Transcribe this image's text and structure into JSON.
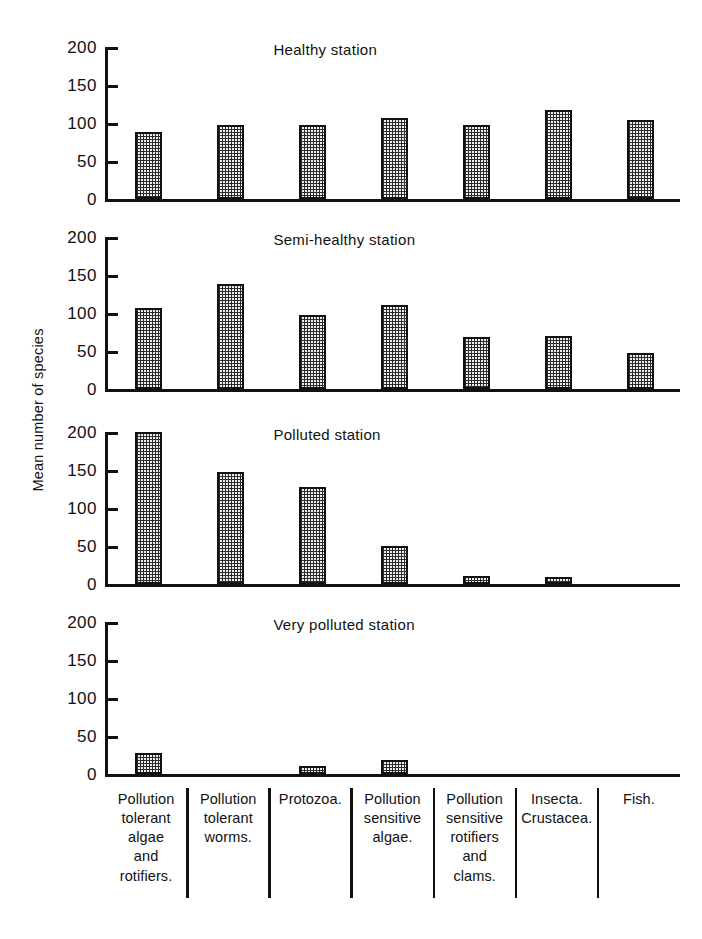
{
  "axis": {
    "ylabel": "Mean number of species",
    "ticks": [
      0,
      50,
      100,
      150,
      200
    ],
    "tick_labels": [
      "0",
      "50",
      "100",
      "150",
      "200"
    ],
    "ymax": 200
  },
  "categories": [
    {
      "lines": [
        "Pollution",
        "tolerant",
        "algae",
        "and",
        "rotifiers."
      ]
    },
    {
      "lines": [
        "Pollution",
        "tolerant",
        "worms."
      ]
    },
    {
      "lines": [
        "Protozoa."
      ]
    },
    {
      "lines": [
        "Pollution",
        "sensitive",
        "algae."
      ]
    },
    {
      "lines": [
        "Pollution",
        "sensitive",
        "rotifiers",
        "and",
        "clams."
      ]
    },
    {
      "lines": [
        "Insecta.",
        "Crustacea."
      ]
    },
    {
      "lines": [
        "Fish."
      ]
    }
  ],
  "panels": [
    {
      "title": "Healthy station"
    },
    {
      "title": "Semi-healthy station"
    },
    {
      "title": "Polluted station"
    },
    {
      "title": "Very polluted station"
    }
  ],
  "chart_data": {
    "type": "bar",
    "xlabel": "",
    "ylabel": "Mean number of species",
    "ylim": [
      0,
      200
    ],
    "yticks": [
      0,
      50,
      100,
      150,
      200
    ],
    "grid": false,
    "legend": "none",
    "layout": "4 stacked subpanels sharing one category axis",
    "categories": [
      "Pollution tolerant algae and rotifiers.",
      "Pollution tolerant worms.",
      "Protozoa.",
      "Pollution sensitive algae.",
      "Pollution sensitive rotifiers and clams.",
      "Insecta. Crustacea.",
      "Fish."
    ],
    "series": [
      {
        "name": "Healthy station",
        "values": [
          88,
          98,
          98,
          107,
          97,
          117,
          104
        ]
      },
      {
        "name": "Semi-healthy station",
        "values": [
          107,
          138,
          97,
          110,
          68,
          70,
          47
        ]
      },
      {
        "name": "Polluted station",
        "values": [
          200,
          148,
          128,
          50,
          10,
          9,
          0
        ]
      },
      {
        "name": "Very polluted station",
        "values": [
          27,
          0,
          10,
          18,
          0,
          0,
          0
        ]
      }
    ]
  }
}
